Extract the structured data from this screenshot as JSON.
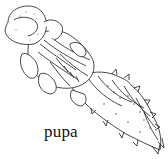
{
  "figure": {
    "caption": "pupa",
    "colors": {
      "ink": "#1a1a1a",
      "background": "#ffffff",
      "stipple": "#555555"
    }
  }
}
